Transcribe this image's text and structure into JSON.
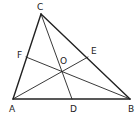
{
  "diagram": {
    "stroke_color": "#222222",
    "background": "#ffffff",
    "points": {
      "A": {
        "label": "A",
        "x": 13,
        "y": 99,
        "lx": 9,
        "ly": 112
      },
      "B": {
        "label": "B",
        "x": 130,
        "y": 99,
        "lx": 128,
        "ly": 112
      },
      "C": {
        "label": "C",
        "x": 41,
        "y": 14,
        "lx": 37,
        "ly": 10
      },
      "D": {
        "label": "D",
        "x": 72,
        "y": 99,
        "lx": 70,
        "ly": 112
      },
      "E": {
        "label": "E",
        "x": 88,
        "y": 57,
        "lx": 91,
        "ly": 54
      },
      "F": {
        "label": "F",
        "x": 26,
        "y": 57,
        "lx": 17,
        "ly": 58
      },
      "O": {
        "label": "O",
        "x": 62,
        "y": 71,
        "lx": 60,
        "ly": 64
      }
    },
    "segments": [
      {
        "from": "A",
        "to": "B",
        "kind": "side"
      },
      {
        "from": "B",
        "to": "C",
        "kind": "side"
      },
      {
        "from": "C",
        "to": "A",
        "kind": "side"
      },
      {
        "from": "A",
        "to": "E",
        "kind": "cevian"
      },
      {
        "from": "B",
        "to": "F",
        "kind": "cevian"
      },
      {
        "from": "C",
        "to": "D",
        "kind": "cevian"
      }
    ]
  }
}
